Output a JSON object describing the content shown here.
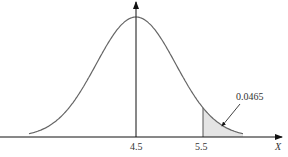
{
  "chart_data": {
    "type": "area",
    "title": "",
    "xlabel": "X",
    "ylabel": "",
    "distribution": "normal",
    "mean": 4.5,
    "sd": 0.595,
    "x_ticks": [
      "4.5",
      "5.5"
    ],
    "shaded_region": {
      "from": 5.5,
      "to": "inf",
      "probability": 0.0465
    },
    "annotation": "0.0465",
    "grid": false
  },
  "labels": {
    "mean": "4.5",
    "cut": "5.5",
    "x_axis": "X",
    "area": "0.0465"
  }
}
